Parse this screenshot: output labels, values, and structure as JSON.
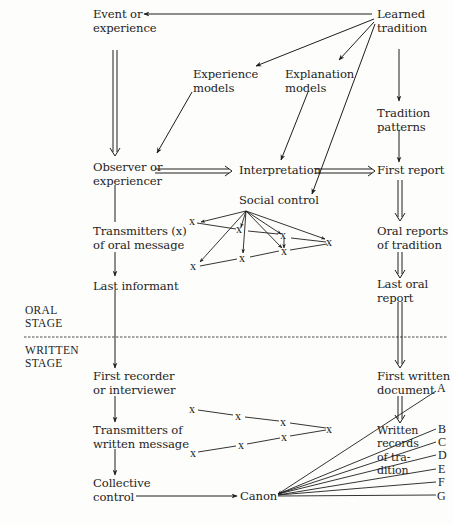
{
  "diagram": {
    "nodes": {
      "event": "Event or\nexperience",
      "learned_tradition": "Learned\ntradition",
      "experience_models": "Experience\nmodels",
      "explanation_models": "Explanation\nmodels",
      "tradition_patterns": "Tradition\npatterns",
      "observer": "Observer or\nexperiencer",
      "interpretation": "Interpretation",
      "first_report": "First report",
      "social_control": "Social control",
      "transmitters_oral": "Transmitters (x)\nof oral message",
      "oral_reports": "Oral reports\nof tradition",
      "last_informant": "Last informant",
      "last_oral_report": "Last oral\nreport",
      "first_recorder": "First recorder\nor interviewer",
      "first_written_document": "First written\ndocument",
      "transmitters_written": "Transmitters of\nwritten message",
      "written_records": "Written\nrecords\nof tra-\ndition",
      "collective_control": "Collective\ncontrol",
      "canon": "Canon"
    },
    "stages": {
      "oral": "ORAL\nSTAGE",
      "written": "WRITTEN\nSTAGE"
    },
    "transmitter_marker": "x",
    "document_letters": [
      "A",
      "B",
      "C",
      "D",
      "E",
      "F",
      "G"
    ]
  }
}
